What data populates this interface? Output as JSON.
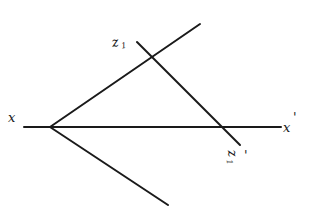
{
  "diagram": {
    "type": "hand-drawn geometric construction",
    "background": "#ffffff",
    "ink_color": "#1a1a1a",
    "labels": {
      "x_left": "x",
      "x_right": "x",
      "x_right_mark": "'",
      "z_top": "z",
      "z_top_sub": "1",
      "z_bottom": "z",
      "z_bottom_sub": "1",
      "z_bottom_mark": "'"
    },
    "lines": [
      {
        "name": "x-axis",
        "from": [
          24,
          127
        ],
        "to": [
          281,
          127
        ]
      },
      {
        "name": "upper-ray",
        "from": [
          50,
          127
        ],
        "to": [
          200,
          24
        ]
      },
      {
        "name": "lower-ray",
        "from": [
          50,
          127
        ],
        "to": [
          168,
          205
        ]
      },
      {
        "name": "z1-line",
        "from": [
          137,
          42
        ],
        "to": [
          240,
          145
        ]
      }
    ],
    "vertex": [
      50,
      127
    ]
  }
}
